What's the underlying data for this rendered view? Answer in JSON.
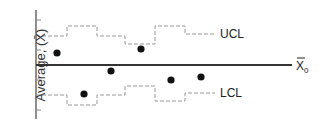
{
  "chart_data": {
    "type": "line",
    "title": "",
    "xlabel": "",
    "ylabel": "Average, (X̄)",
    "center_line_label": "X̄0",
    "ucl_label": "UCL",
    "lcl_label": "LCL",
    "grid": false,
    "series": [
      {
        "name": "Sample averages",
        "style": "points",
        "values": [
          {
            "x": 57,
            "y": 53
          },
          {
            "x": 84,
            "y": 94
          },
          {
            "x": 111,
            "y": 71
          },
          {
            "x": 141,
            "y": 49
          },
          {
            "x": 171,
            "y": 80
          },
          {
            "x": 201,
            "y": 77
          }
        ]
      },
      {
        "name": "UCL",
        "style": "dashed-step",
        "segments": [
          {
            "x0": 36,
            "x1": 67,
            "y": 36
          },
          {
            "x0": 67,
            "x1": 97,
            "y": 26
          },
          {
            "x0": 97,
            "x1": 125,
            "y": 36
          },
          {
            "x0": 125,
            "x1": 155,
            "y": 44
          },
          {
            "x0": 155,
            "x1": 185,
            "y": 26
          },
          {
            "x0": 185,
            "x1": 215,
            "y": 34
          }
        ]
      },
      {
        "name": "LCL",
        "style": "dashed-step",
        "segments": [
          {
            "x0": 36,
            "x1": 67,
            "y": 95
          },
          {
            "x0": 67,
            "x1": 97,
            "y": 105
          },
          {
            "x0": 97,
            "x1": 125,
            "y": 95
          },
          {
            "x0": 125,
            "x1": 155,
            "y": 86
          },
          {
            "x0": 155,
            "x1": 185,
            "y": 101
          },
          {
            "x0": 185,
            "x1": 215,
            "y": 93
          }
        ]
      },
      {
        "name": "Center line X̄0",
        "style": "solid",
        "y": 65
      }
    ]
  },
  "labels": {
    "y_axis": "Average, (X̄)",
    "center": "X",
    "center_sub": "0",
    "ucl": "UCL",
    "lcl": "LCL"
  }
}
